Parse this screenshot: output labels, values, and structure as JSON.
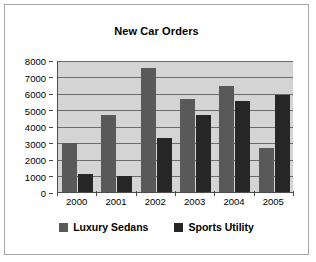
{
  "chart_data": {
    "type": "bar",
    "title": "New Car Orders",
    "xlabel": "",
    "ylabel": "",
    "categories": [
      "2000",
      "2001",
      "2002",
      "2003",
      "2004",
      "2005"
    ],
    "series": [
      {
        "name": "Luxury Sedans",
        "color": "#595959",
        "values": [
          3000,
          4650,
          7500,
          5650,
          6400,
          2650
        ]
      },
      {
        "name": "Sports Utility",
        "color": "#262626",
        "values": [
          1100,
          950,
          3250,
          4650,
          5500,
          5850
        ]
      }
    ],
    "ylim": [
      0,
      8000
    ],
    "yticks": [
      0,
      1000,
      2000,
      3000,
      4000,
      5000,
      6000,
      7000,
      8000
    ],
    "ytick_labels": [
      "0",
      "1000",
      "2000",
      "3000",
      "4000",
      "5000",
      "6000",
      "7000",
      "8000"
    ],
    "grid": true,
    "grid_axis": "y",
    "legend_position": "bottom",
    "plot_background": "#d4d4d4",
    "chart_background": "#ffffff",
    "border_color": "#a6a6a6"
  }
}
